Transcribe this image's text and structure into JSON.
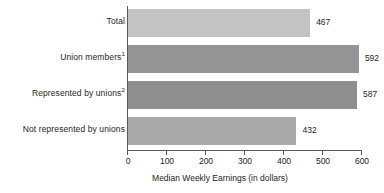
{
  "chart_data": {
    "type": "bar",
    "orientation": "horizontal",
    "title": "",
    "xlabel": "Median Weekly Earnings (in dollars)",
    "ylabel": "",
    "xlim": [
      0,
      600
    ],
    "xticks": [
      0,
      100,
      200,
      300,
      400,
      500,
      600
    ],
    "xtick_labels": [
      "0",
      "100",
      "200",
      "300",
      "400",
      "500",
      "600"
    ],
    "grid": false,
    "legend": null,
    "categories": [
      "Total",
      "Union members",
      "Represented by unions",
      "Not represented by unions"
    ],
    "category_footnotes": [
      "",
      "1",
      "2",
      ""
    ],
    "values": [
      467,
      592,
      587,
      432
    ],
    "value_labels": [
      "467",
      "592",
      "587",
      "432"
    ],
    "bar_colors": [
      "#c3c3c3",
      "#949494",
      "#8f8f8f",
      "#aaaaaa"
    ],
    "axis_color": "#58595b"
  }
}
